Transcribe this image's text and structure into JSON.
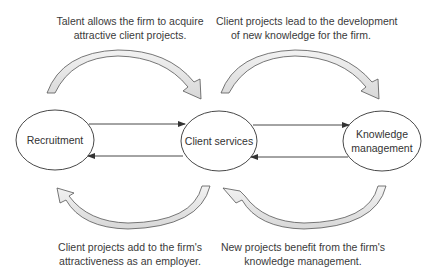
{
  "diagram": {
    "nodes": [
      {
        "id": "recruitment",
        "label": "Recruitment"
      },
      {
        "id": "client_services",
        "label": "Client services"
      },
      {
        "id": "knowledge_management",
        "label_line1": "Knowledge",
        "label_line2": "management"
      }
    ],
    "captions": {
      "top_left": {
        "line1": "Talent allows the firm to acquire",
        "line2": "attractive client projects."
      },
      "top_right": {
        "line1": "Client projects lead to the development",
        "line2": "of new knowledge for the firm."
      },
      "bottom_left": {
        "line1": "Client projects add to the firm's",
        "line2": "attractiveness as an employer."
      },
      "bottom_right": {
        "line1": "New projects benefit from the firm's",
        "line2": "knowledge management."
      }
    },
    "edges": [
      {
        "from": "recruitment",
        "to": "client_services"
      },
      {
        "from": "client_services",
        "to": "recruitment"
      },
      {
        "from": "client_services",
        "to": "knowledge_management"
      },
      {
        "from": "knowledge_management",
        "to": "client_services"
      }
    ],
    "colors": {
      "stroke": "#333333",
      "arrow_fill": "#e6e6e6"
    }
  }
}
